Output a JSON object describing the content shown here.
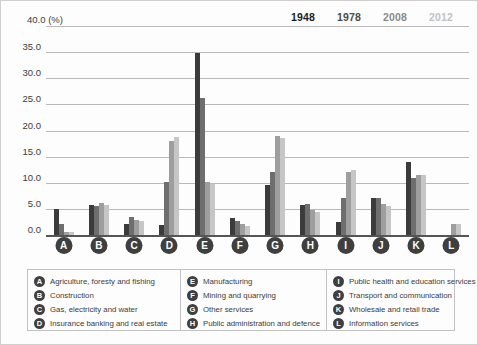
{
  "chart_data": {
    "type": "bar",
    "title": "",
    "subtitle": "",
    "xlabel": "",
    "ylabel": "40.0 (%)",
    "unit_label": "40.0 (%)",
    "ylim": [
      0,
      40
    ],
    "yticks": [
      "0.0",
      "5.0",
      "10.0",
      "15.0",
      "20.0",
      "25.0",
      "30.0",
      "35.0",
      "40.0"
    ],
    "grid": true,
    "legend_position": "top-right",
    "categories": [
      "A",
      "B",
      "C",
      "D",
      "E",
      "F",
      "G",
      "H",
      "I",
      "J",
      "K",
      "L"
    ],
    "category_names": [
      "Agriculture, foresty and fishing",
      "Construction",
      "Gas, electricity and water",
      "Insurance banking and real estate",
      "Manufacturing",
      "Mining and quarrying",
      "Other services",
      "Public administration and defence",
      "Public health and education services",
      "Transport and communication",
      "Wholesale and retail trade",
      "Information services"
    ],
    "series": [
      {
        "name": "1948",
        "color": "#3b3b3b",
        "values": [
          5.0,
          5.8,
          2.2,
          2.0,
          34.8,
          3.3,
          9.5,
          5.8,
          2.5,
          7.0,
          14.0,
          0.0
        ]
      },
      {
        "name": "1978",
        "color": "#6e6e6e",
        "values": [
          2.2,
          5.6,
          3.4,
          10.2,
          26.3,
          2.6,
          12.0,
          6.0,
          7.0,
          7.0,
          11.0,
          0.0
        ]
      },
      {
        "name": "2008",
        "color": "#9e9e9e",
        "values": [
          0.6,
          6.1,
          2.9,
          18.0,
          10.2,
          2.1,
          19.0,
          4.8,
          12.0,
          6.0,
          11.5,
          2.2
        ]
      },
      {
        "name": "2012",
        "color": "#c6c6c6",
        "values": [
          0.5,
          5.7,
          2.6,
          18.8,
          9.8,
          1.8,
          18.5,
          4.5,
          12.5,
          5.5,
          11.5,
          2.2
        ]
      }
    ]
  },
  "year_keys": [
    {
      "label": "1948",
      "color": "#1c1c1c",
      "x": 290
    },
    {
      "label": "1978",
      "color": "#4b4b4b",
      "x": 336
    },
    {
      "label": "2008",
      "color": "#8a8a8a",
      "x": 382
    },
    {
      "label": "2012",
      "color": "#c2c2c2",
      "x": 428
    }
  ],
  "legend": {
    "columns": [
      {
        "items": [
          {
            "key": "A",
            "label": "Agriculture, foresty and fishing"
          },
          {
            "key": "B",
            "label": "Construction"
          },
          {
            "key": "C",
            "label": "Gas, electricity and water"
          },
          {
            "key": "D",
            "label": "Insurance banking and real estate"
          }
        ]
      },
      {
        "items": [
          {
            "key": "E",
            "label": "Manufacturing"
          },
          {
            "key": "F",
            "label": "Mining and quarrying"
          },
          {
            "key": "G",
            "label": "Other services"
          },
          {
            "key": "H",
            "label": "Public administration and defence"
          }
        ]
      },
      {
        "items": [
          {
            "key": "I",
            "label": "Public health and education services"
          },
          {
            "key": "J",
            "label": "Transport and communication"
          },
          {
            "key": "K",
            "label": "Wholesale and retail trade"
          },
          {
            "key": "L",
            "label": "Information services"
          }
        ]
      }
    ]
  }
}
